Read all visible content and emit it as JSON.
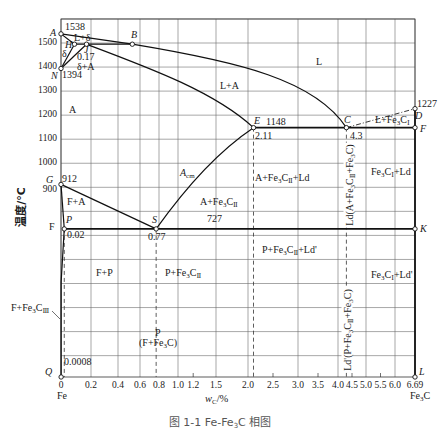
{
  "figure": {
    "caption": "图 1-1  Fe-Fe₃C 相图"
  },
  "chart_data": {
    "type": "line",
    "xlabel": "w_C/%",
    "xlabel_parts": {
      "var": "w",
      "sub": "C",
      "unit": "/%"
    },
    "ylabel": "温度/°C",
    "xlim": [
      0,
      6.69
    ],
    "ylim": [
      null,
      1600
    ],
    "grid": true,
    "legend": "none",
    "x_ticks": [
      "0",
      "0.2",
      "0.4",
      "0.6",
      "0.8",
      "1.0",
      "1.2",
      "1.5",
      "2.0",
      "2.5",
      "3.0",
      "3.5",
      "4.0",
      "4.5",
      "5.0",
      "5.5",
      "6.0",
      "6.69"
    ],
    "x_minor_ticks": [
      1.2,
      2.5,
      3.5,
      4.5,
      5.5
    ],
    "x_grid": [
      0,
      0.2,
      0.4,
      0.6,
      0.8,
      1.0,
      1.5,
      2.0,
      3.0,
      4.0,
      5.0,
      6.0,
      6.69
    ],
    "y_ticks": [
      1500,
      1400,
      1300,
      1200,
      1100,
      1000,
      900
    ],
    "y_grid": [
      1600,
      1500,
      1400,
      1300,
      1200,
      1100,
      1000,
      900,
      800,
      700,
      600,
      500,
      400,
      300,
      200
    ],
    "x_end_labels": {
      "left": "Fe",
      "right": "Fe₃C"
    },
    "points": {
      "A": {
        "label": "A",
        "wC": 0,
        "T": 1538
      },
      "B": {
        "label": "B",
        "wC": 0.53,
        "T": 1495
      },
      "C": {
        "label": "C",
        "wC": 4.3,
        "T": 1148
      },
      "D": {
        "label": "D",
        "wC": 6.69,
        "T": 1227
      },
      "E": {
        "label": "E",
        "wC": 2.11,
        "T": 1148
      },
      "F": {
        "label": "F",
        "wC": 6.69,
        "T": 1148
      },
      "G": {
        "label": "G",
        "wC": 0,
        "T": 912
      },
      "H": {
        "label": "H",
        "wC": 0.09,
        "T": 1495
      },
      "J": {
        "label": "J",
        "wC": 0.17,
        "T": 1495
      },
      "K": {
        "label": "K",
        "wC": 6.69,
        "T": 727
      },
      "L": {
        "label": "L",
        "wC": 6.69,
        "T": null
      },
      "N": {
        "label": "N",
        "wC": 0,
        "T": 1394
      },
      "P": {
        "label": "P",
        "wC": 0.0218,
        "T": 727
      },
      "Q": {
        "label": "Q",
        "wC": 0.0008,
        "T": null
      },
      "S": {
        "label": "S",
        "wC": 0.77,
        "T": 727
      }
    },
    "value_labels": {
      "T_A": "1538",
      "T_N": "1394",
      "wC_J": "0.17",
      "T_G": "912",
      "wC_P": "0.02",
      "T_eutectoid": "727",
      "wC_S": "0.77",
      "T_eutectic": "1148",
      "wC_E": "2.11",
      "wC_C": "4.3",
      "T_D": "1227",
      "wC_Q": "0.0008"
    },
    "left_axis_F_label": "F",
    "boundaries": [
      {
        "id": "AB",
        "from": "A",
        "to": "B",
        "style": "solid"
      },
      {
        "id": "BC",
        "from": "B",
        "to": "C",
        "style": "solid",
        "c1": [
          1.875,
          1421
        ],
        "c2": [
          3.425,
          1346
        ]
      },
      {
        "id": "AH",
        "from": "A",
        "to": "H",
        "style": "solid"
      },
      {
        "id": "HJB",
        "from": "H",
        "to": "B",
        "style": "solid"
      },
      {
        "id": "JE",
        "from": "J",
        "to": "E",
        "style": "solid",
        "c1": [
          0.705,
          1396
        ],
        "c2": [
          1.487,
          1296
        ]
      },
      {
        "id": "NH",
        "from": "N",
        "to": "H",
        "style": "solid"
      },
      {
        "id": "NJ",
        "from": "N",
        "to": "J",
        "style": "solid"
      },
      {
        "id": "GS",
        "from": "G",
        "to": "S",
        "style": "solid"
      },
      {
        "id": "GP",
        "from": "G",
        "to": "P",
        "style": "solid"
      },
      {
        "id": "PQ",
        "from": "P",
        "to": "Q",
        "style": "solid",
        "via": [
          0.0008,
          505
        ]
      },
      {
        "id": "ES",
        "from": "S",
        "to": "E",
        "style": "solid",
        "q": [
          1.355,
          1013
        ]
      },
      {
        "id": "ECF",
        "from": "E",
        "to": "F",
        "style": "thick"
      },
      {
        "id": "PSK",
        "from": "P",
        "to": "K",
        "style": "thick"
      },
      {
        "id": "CD",
        "from": "C",
        "to": "D",
        "style": "dashdot"
      },
      {
        "id": "DL",
        "from": "D",
        "to": "L",
        "style": "thick"
      }
    ],
    "guides": [
      {
        "from": "P",
        "style": "dashed"
      },
      {
        "from": "S",
        "style": "dashed"
      },
      {
        "from": "E",
        "style": "dashed"
      },
      {
        "from": "C",
        "style": "dashed"
      }
    ],
    "regions": {
      "L": "L",
      "L_A": "L+A",
      "L_delta": "L+δ",
      "delta": "δ",
      "delta_A": "δ+A",
      "A": "A",
      "Acm_main": "A",
      "Acm_sub": "cm",
      "A_Fe3CII": "A+Fe₃CⅡ",
      "A_Fe3CII_Ld": "A+Fe₃CⅡ+Ld",
      "L_Fe3CI": "L+Fe₃CⅠ",
      "Fe3CI_Ld": "Fe₃CⅠ+Ld",
      "F_A": "F+A",
      "F_P": "F+P",
      "P_Fe3CII": "P+Fe₃CⅡ",
      "P_Fe3CII_Ld2": "P+Fe₃CⅡ+Ld'",
      "Fe3CI_Ld2": "Fe₃CⅠ+Ld'",
      "F_Fe3CIII": "F+Fe₃CⅢ",
      "pearlite": "P",
      "pearlite_desc": "(F+Fe₃C)",
      "Ld": "Ld(A+Fe₃CⅡ+Fe₃C)",
      "Ld2": "Ld'(P+Fe₃CⅡ+Fe₃C)"
    }
  }
}
